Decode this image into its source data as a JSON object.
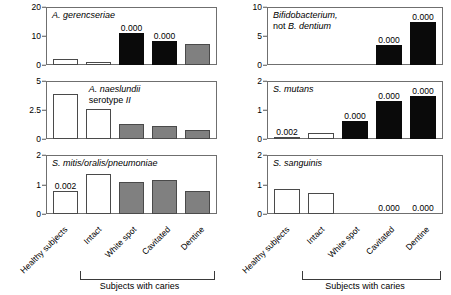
{
  "chart_data": {
    "type": "bar",
    "title": "",
    "xlabel": "",
    "ylabel": "",
    "grid": false,
    "legend": null,
    "categories": [
      "Healthy subjects",
      "Intact",
      "White spot",
      "Cavitated",
      "Dentine"
    ],
    "group_bracket": {
      "label": "Subjects with caries",
      "covers": [
        "Intact",
        "White spot",
        "Cavitated",
        "Dentine"
      ]
    },
    "bar_fill_legend": {
      "white": "#ffffff",
      "gray": "#808080",
      "black": "#0a0a0a"
    },
    "panels": [
      {
        "id": "a-gerencseriae",
        "title": "A. gerencseriae",
        "title_italic": true,
        "title_align": "left",
        "ylim": [
          0,
          20
        ],
        "yticks": [
          0,
          10,
          20
        ],
        "ytick_labels": [
          "0",
          "10",
          "20"
        ],
        "values": [
          2.0,
          1.2,
          11.0,
          8.3,
          7.2
        ],
        "fills": [
          "white",
          "white",
          "black",
          "black",
          "gray"
        ],
        "pvalues": [
          "",
          "",
          "0.000",
          "0.000",
          ""
        ]
      },
      {
        "id": "bifidobacterium",
        "title": "Bifidobacterium,\nnot B. dentium",
        "title_italic": true,
        "title_align": "left",
        "ylim": [
          0,
          10
        ],
        "yticks": [
          0,
          5,
          10
        ],
        "ytick_labels": [
          "0",
          "5",
          "10"
        ],
        "values": [
          0,
          0,
          0,
          3.4,
          7.5
        ],
        "fills": [
          "zero",
          "zero",
          "zero",
          "black",
          "black"
        ],
        "pvalues": [
          "",
          "",
          "",
          "0.000",
          "0.000"
        ]
      },
      {
        "id": "a-naeslundii-serotype-ii",
        "title": "A. naeslundii serotype II",
        "title_italic": true,
        "title_align": "center",
        "ylim": [
          0,
          5
        ],
        "yticks": [
          0,
          2.5,
          5
        ],
        "ytick_labels": [
          "0",
          "2.5",
          "5"
        ],
        "values": [
          3.9,
          2.6,
          1.3,
          1.1,
          0.75
        ],
        "fills": [
          "white",
          "white",
          "gray",
          "gray",
          "gray"
        ],
        "pvalues": [
          "",
          "",
          "",
          "",
          ""
        ]
      },
      {
        "id": "s-mutans",
        "title": "S. mutans",
        "title_italic": true,
        "title_align": "left",
        "ylim": [
          0,
          2
        ],
        "yticks": [
          0,
          1,
          2
        ],
        "ytick_labels": [
          "0",
          "1",
          "2"
        ],
        "values": [
          0.08,
          0.2,
          0.62,
          1.3,
          1.47
        ],
        "fills": [
          "gray",
          "white",
          "black",
          "black",
          "black"
        ],
        "pvalues": [
          "0.002",
          "",
          "0.000",
          "0.000",
          "0.000"
        ]
      },
      {
        "id": "s-mitis-oralis-pneumoniae",
        "title": "S. mitis/oralis/pneumoniae",
        "title_italic": true,
        "title_align": "left",
        "ylim": [
          0,
          2
        ],
        "yticks": [
          0,
          1,
          2
        ],
        "ytick_labels": [
          "0",
          "1",
          "2"
        ],
        "values": [
          0.78,
          1.35,
          1.08,
          1.14,
          0.78
        ],
        "fills": [
          "white",
          "white",
          "gray",
          "gray",
          "gray"
        ],
        "pvalues": [
          "0.002",
          "",
          "",
          "",
          ""
        ]
      },
      {
        "id": "s-sanguinis",
        "title": "S. sanguinis",
        "title_italic": true,
        "title_align": "left",
        "ylim": [
          0,
          2
        ],
        "yticks": [
          0,
          1,
          2
        ],
        "ytick_labels": [
          "0",
          "1",
          "2"
        ],
        "values": [
          0.85,
          0.72,
          0,
          0,
          0
        ],
        "fills": [
          "white",
          "white",
          "zero",
          "zero",
          "zero"
        ],
        "pvalues": [
          "",
          "",
          "",
          "0.000",
          "0.000"
        ]
      }
    ]
  }
}
